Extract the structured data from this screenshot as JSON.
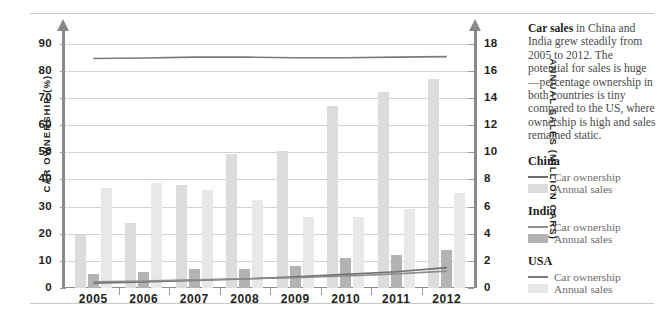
{
  "chart_data": {
    "type": "bar",
    "title": "",
    "xlabel": "",
    "categories": [
      "2005",
      "2006",
      "2007",
      "2008",
      "2009",
      "2010",
      "2011",
      "2012"
    ],
    "left_axis": {
      "label": "CAR OWNERSHIP (%)",
      "ticks": [
        0,
        10,
        20,
        30,
        40,
        50,
        60,
        70,
        80,
        90
      ],
      "ylim": [
        0,
        95
      ]
    },
    "right_axis": {
      "label": "ANNUAL SALES (MILLION CARS)",
      "ticks": [
        0,
        2,
        4,
        6,
        8,
        10,
        12,
        14,
        16,
        18
      ],
      "ylim": [
        0,
        19
      ]
    },
    "grid": true,
    "legend_position": "right",
    "series": [
      {
        "name": "China Annual sales",
        "type": "bar",
        "unit": "million cars",
        "color": "#dcdcdc",
        "values": [
          3.9,
          4.8,
          7.6,
          9.9,
          10.1,
          13.4,
          14.4,
          15.4
        ]
      },
      {
        "name": "India Annual sales",
        "type": "bar",
        "unit": "million cars",
        "color": "#b3b3b3",
        "values": [
          1.0,
          1.2,
          1.4,
          1.4,
          1.6,
          2.2,
          2.4,
          2.8
        ]
      },
      {
        "name": "USA Annual sales",
        "type": "bar",
        "unit": "million cars",
        "color": "#e8e8e8",
        "values": [
          7.4,
          7.7,
          7.2,
          6.5,
          5.2,
          5.2,
          5.8,
          7.0
        ]
      },
      {
        "name": "China Car ownership",
        "type": "line",
        "unit": "percent",
        "color": "#6f6f6f",
        "values": [
          1.8,
          2.2,
          2.8,
          3.3,
          4.1,
          5.0,
          6.0,
          7.5
        ]
      },
      {
        "name": "India Car ownership",
        "type": "line",
        "unit": "percent",
        "color": "#8f8f8f",
        "values": [
          2.3,
          2.6,
          3.0,
          3.4,
          3.8,
          4.4,
          5.2,
          6.2
        ]
      },
      {
        "name": "USA Car ownership",
        "type": "line",
        "unit": "percent",
        "color": "#7a7a7a",
        "values": [
          84.5,
          84.7,
          85.0,
          85.0,
          84.8,
          84.8,
          85.0,
          85.2
        ]
      }
    ]
  },
  "panel": {
    "intro_bold": "Car sales",
    "intro_rest": " in China and India grew steadily from 2005 to 2012. The potential for sales is huge—percentage ownership in both countries is tiny compared to the US, where ownership is high and sales remained static.",
    "legend": [
      {
        "title": "China",
        "line_label": "Car ownership",
        "bar_label": "Annual sales",
        "line_color": "#6f6f6f",
        "bar_color": "#dcdcdc"
      },
      {
        "title": "India",
        "line_label": "Car ownership",
        "bar_label": "Annual sales",
        "line_color": "#8f8f8f",
        "bar_color": "#b3b3b3"
      },
      {
        "title": "USA",
        "line_label": "Car ownership",
        "bar_label": "Annual sales",
        "line_color": "#7a7a7a",
        "bar_color": "#e8e8e8"
      }
    ]
  }
}
